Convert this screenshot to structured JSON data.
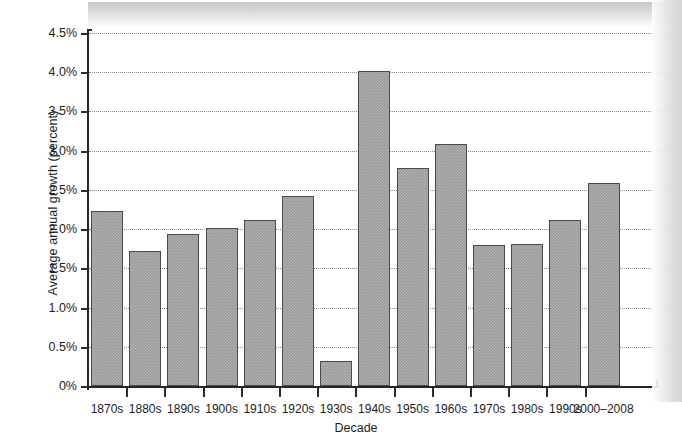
{
  "chart_data": {
    "type": "bar",
    "title": "",
    "xlabel": "Decade",
    "ylabel": "Average annual growth (percent)",
    "categories": [
      "1870s",
      "1880s",
      "1890s",
      "1900s",
      "1910s",
      "1920s",
      "1930s",
      "1940s",
      "1950s",
      "1960s",
      "1970s",
      "1980s",
      "1990s",
      "2000–2008"
    ],
    "values": [
      2.23,
      1.72,
      1.94,
      2.01,
      2.12,
      2.42,
      0.32,
      4.01,
      2.78,
      3.08,
      1.8,
      1.81,
      2.11,
      2.59
    ],
    "ylim": [
      0,
      4.5
    ],
    "ytick_values": [
      0,
      0.5,
      1.0,
      1.5,
      2.0,
      2.5,
      3.0,
      3.5,
      4.0,
      4.5
    ],
    "ytick_labels": [
      "0%",
      "0.5%",
      "1.0%",
      "1.5%",
      "2.0%",
      "2.5%",
      "3.0%",
      "3.5%",
      "4.0%",
      "4.5%"
    ],
    "grid": true,
    "legend": null,
    "bar_color": "#9b9b9b",
    "bar_edge_color": "#4a4a4a",
    "gridline_color": "#8c8c8c",
    "axis_color": "#262626"
  }
}
